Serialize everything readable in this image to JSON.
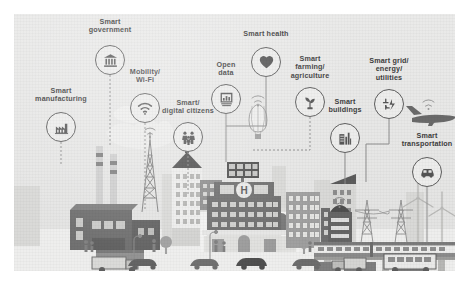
{
  "poster": {
    "title_visible": false,
    "background_color": "#e8e8e7",
    "ink_color": "#5d5d5d",
    "label_color": "#3c3c3c",
    "style": "flat grayscale smart-city isometric illustration on textured paper"
  },
  "nodes": [
    {
      "id": "smart-manufacturing",
      "label": "Smart\nmanufacturing",
      "icon": "factory-icon",
      "x": 47,
      "y": 113,
      "label_y": -40,
      "connector": "dotted"
    },
    {
      "id": "smart-government",
      "label": "Smart\ngovernment",
      "icon": "bank-icon",
      "x": 96,
      "y": 46,
      "label_y": -42,
      "connector": "dotted"
    },
    {
      "id": "mobility-wifi",
      "label": "Mobility/\nWi-Fi",
      "icon": "wifi-icon",
      "x": 131,
      "y": 94,
      "label_y": -40,
      "connector": "dotted"
    },
    {
      "id": "smart-digital-citizens",
      "label": "Smart/\ndigital citizens",
      "icon": "people-icon",
      "x": 174,
      "y": 123,
      "label_y": -38,
      "connector": "dotted"
    },
    {
      "id": "open-data",
      "label": "Open\ndata",
      "icon": "bar-chart-icon",
      "x": 212,
      "y": 85,
      "label_y": -38,
      "connector": "solid"
    },
    {
      "id": "smart-health",
      "label": "Smart health",
      "icon": "heart-icon",
      "x": 252,
      "y": 48,
      "label_y": -32,
      "connector": "solid"
    },
    {
      "id": "smart-farming",
      "label": "Smart\nfarming/\nagriculture",
      "icon": "seedling-icon",
      "x": 296,
      "y": 88,
      "label_y": -47,
      "connector": "dotted"
    },
    {
      "id": "smart-buildings",
      "label": "Smart\nbuildings",
      "icon": "buildings-icon",
      "x": 331,
      "y": 124,
      "label_y": -40,
      "connector": "solid"
    },
    {
      "id": "smart-grid",
      "label": "Smart grid/\nenergy/\nutilities",
      "icon": "power-plug-icon",
      "x": 375,
      "y": 90,
      "label_y": -47,
      "connector": "solid"
    },
    {
      "id": "smart-transportation",
      "label": "Smart\ntransportation",
      "icon": "car-icon",
      "x": 413,
      "y": 158,
      "label_y": -40,
      "connector": "solid"
    }
  ],
  "scene": {
    "hospital_sign": "H",
    "elements": [
      "factory-with-smokestacks",
      "smoke-plume",
      "office-tower",
      "radio-mast",
      "arched-retail-block",
      "solar-panel-array",
      "hospital-building",
      "high-rise-cluster",
      "hot-air-balloon",
      "airplane-with-wifi",
      "transmission-pylons",
      "wind-turbines",
      "elevated-tram",
      "city-bus",
      "delivery-truck",
      "cars",
      "pedestrians",
      "street-lamps",
      "trees"
    ],
    "palette": {
      "dark": "#5a5a5a",
      "mid": "#8e8e8e",
      "light": "#c4c4c2",
      "pale": "#dedede",
      "sky": "#e9e9e8",
      "ground": "#eeeeed"
    }
  }
}
